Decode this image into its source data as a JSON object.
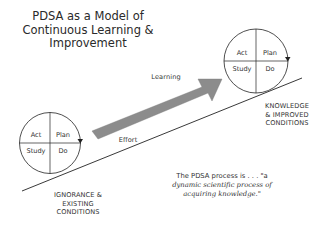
{
  "title": {
    "line1": "PDSA as a Model of",
    "line2": "Continuous Learning &",
    "line3": "Improvement"
  },
  "start_cycle": {
    "quadrants": {
      "top_left": "Act",
      "top_right": "Plan",
      "bottom_left": "Study",
      "bottom_right": "Do"
    },
    "label": {
      "line1": "IGNORANCE &",
      "line2": "EXISTING",
      "line3": "CONDITIONS"
    }
  },
  "end_cycle": {
    "quadrants": {
      "top_left": "Act",
      "top_right": "Plan",
      "bottom_left": "Study",
      "bottom_right": "Do"
    },
    "label": {
      "line1": "KNOWLEDGE",
      "line2": "& IMPROVED",
      "line3": "CONDITIONS"
    }
  },
  "arrow_label": "Learning",
  "slope_label": "Effort",
  "quote": {
    "lead": "The PDSA process is . . . \"a",
    "line2": "dynamic scientific process of",
    "line3": "acquiring knowledge.\""
  },
  "colors": {
    "arrow_fill": "#8c8c8c",
    "line": "#222222",
    "text": "#333333",
    "background": "#ffffff"
  }
}
